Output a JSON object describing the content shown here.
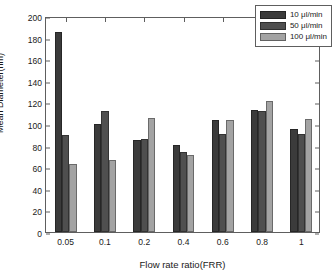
{
  "chart_data": {
    "type": "bar",
    "title": "",
    "subtitle": "",
    "xlabel": "Flow rate ratio(FRR)",
    "ylabel": "Mean Diameter(nm)",
    "categories": [
      "0.05",
      "0.1",
      "0.2",
      "0.4",
      "0.6",
      "0.8",
      "1"
    ],
    "series": [
      {
        "name": "10 μl/min",
        "color": "#3b3b3b",
        "values": [
          185,
          100,
          85,
          81,
          104,
          113,
          95
        ]
      },
      {
        "name": "50 μl/min",
        "color": "#4f4f4f",
        "values": [
          90,
          112,
          86,
          74,
          91,
          112,
          91
        ]
      },
      {
        "name": "100 μl/min",
        "color": "#a3a3a3",
        "values": [
          63,
          67,
          106,
          71,
          104,
          121,
          105
        ]
      }
    ],
    "ylim": [
      0,
      200
    ],
    "yticks": [
      0,
      20,
      40,
      60,
      80,
      100,
      120,
      140,
      160,
      180,
      200
    ],
    "ytick_labels": [
      "0",
      "20",
      "40",
      "60",
      "80",
      "100",
      "120",
      "140",
      "160",
      "180",
      "200"
    ],
    "grid": false,
    "legend_position": "top-right",
    "axis_color": "#5e5e5e",
    "background": "#ffffff"
  },
  "legend": {
    "entries": [
      {
        "label": "10 μl/min"
      },
      {
        "label": "50 μl/min"
      },
      {
        "label": "100 μl/min"
      }
    ]
  }
}
